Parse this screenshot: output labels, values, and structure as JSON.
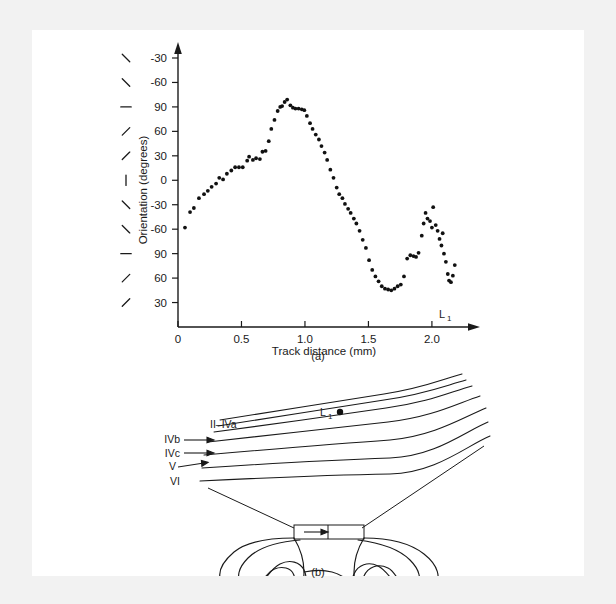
{
  "figure": {
    "panel_a_caption": "(a)",
    "panel_b_caption": "(b)"
  },
  "chart_data": {
    "type": "scatter",
    "title": "",
    "xlabel": "Track distance (mm)",
    "ylabel": "Orientation (degrees)",
    "xlim": [
      0,
      2.3
    ],
    "ylim": [
      0,
      330
    ],
    "grid": false,
    "legend": null,
    "xticks": [
      0,
      0.5,
      1.0,
      1.5,
      2.0
    ],
    "xticklabels": [
      "0",
      "0.5",
      "1.0",
      "1.5",
      "2.0"
    ],
    "yticks": [
      330,
      300,
      270,
      240,
      210,
      180,
      150,
      120,
      90,
      60,
      30
    ],
    "yticklabels": [
      "-30",
      "-60",
      "90",
      "60",
      "30",
      "0",
      "-30",
      "-60",
      "90",
      "60",
      "30"
    ],
    "ytick_orientation_glyphs": [
      "\\",
      "\\",
      "—",
      "/",
      "/",
      "|",
      "\\",
      "\\",
      "—",
      "/",
      "/"
    ],
    "annotations": [
      {
        "text": "L",
        "sub": "1",
        "x": 2.12,
        "y": 52
      }
    ],
    "series": [
      {
        "name": "orientation along track",
        "marker": "filled-circle",
        "color": "#111111",
        "points": [
          [
            0.055,
            122
          ],
          [
            0.095,
            141
          ],
          [
            0.125,
            146
          ],
          [
            0.165,
            158
          ],
          [
            0.205,
            163
          ],
          [
            0.235,
            167
          ],
          [
            0.265,
            172
          ],
          [
            0.3,
            176
          ],
          [
            0.325,
            183
          ],
          [
            0.355,
            181
          ],
          [
            0.385,
            188
          ],
          [
            0.42,
            192
          ],
          [
            0.45,
            196
          ],
          [
            0.48,
            196
          ],
          [
            0.51,
            196
          ],
          [
            0.545,
            204
          ],
          [
            0.56,
            209
          ],
          [
            0.59,
            205
          ],
          [
            0.615,
            207
          ],
          [
            0.645,
            206
          ],
          [
            0.665,
            215
          ],
          [
            0.69,
            216
          ],
          [
            0.715,
            228
          ],
          [
            0.735,
            243
          ],
          [
            0.76,
            254
          ],
          [
            0.785,
            265
          ],
          [
            0.805,
            270
          ],
          [
            0.82,
            271
          ],
          [
            0.84,
            276
          ],
          [
            0.86,
            279
          ],
          [
            0.885,
            272
          ],
          [
            0.905,
            269
          ],
          [
            0.925,
            268
          ],
          [
            0.95,
            268
          ],
          [
            0.975,
            267
          ],
          [
            0.995,
            266
          ],
          [
            1.015,
            259
          ],
          [
            1.04,
            250
          ],
          [
            1.06,
            243
          ],
          [
            1.085,
            236
          ],
          [
            1.11,
            230
          ],
          [
            1.13,
            222
          ],
          [
            1.155,
            214
          ],
          [
            1.175,
            205
          ],
          [
            1.2,
            193
          ],
          [
            1.225,
            183
          ],
          [
            1.25,
            171
          ],
          [
            1.27,
            163
          ],
          [
            1.295,
            158
          ],
          [
            1.315,
            151
          ],
          [
            1.34,
            145
          ],
          [
            1.36,
            140
          ],
          [
            1.385,
            133
          ],
          [
            1.405,
            127
          ],
          [
            1.43,
            118
          ],
          [
            1.455,
            107
          ],
          [
            1.48,
            97
          ],
          [
            1.505,
            82
          ],
          [
            1.53,
            70
          ],
          [
            1.555,
            62
          ],
          [
            1.58,
            56
          ],
          [
            1.605,
            50
          ],
          [
            1.63,
            47
          ],
          [
            1.655,
            46
          ],
          [
            1.68,
            45
          ],
          [
            1.705,
            47
          ],
          [
            1.73,
            50
          ],
          [
            1.755,
            52
          ],
          [
            1.78,
            62
          ],
          [
            1.805,
            84
          ],
          [
            1.83,
            88
          ],
          [
            1.855,
            87
          ],
          [
            1.875,
            86
          ],
          [
            1.895,
            91
          ],
          [
            1.92,
            112
          ],
          [
            1.935,
            127
          ],
          [
            1.95,
            140
          ],
          [
            1.965,
            133
          ],
          [
            1.985,
            130
          ],
          [
            2.0,
            122
          ],
          [
            2.01,
            147
          ],
          [
            2.03,
            125
          ],
          [
            2.045,
            118
          ],
          [
            2.06,
            108
          ],
          [
            2.075,
            100
          ],
          [
            2.085,
            115
          ],
          [
            2.095,
            90
          ],
          [
            2.11,
            80
          ],
          [
            2.125,
            65
          ],
          [
            2.135,
            57
          ],
          [
            2.15,
            55
          ],
          [
            2.165,
            63
          ],
          [
            2.18,
            76
          ]
        ]
      }
    ]
  },
  "diagram": {
    "layer_labels": [
      {
        "id": "layer-ii-iva",
        "text": "II–IVa"
      },
      {
        "id": "layer-ivb",
        "text": "IVb"
      },
      {
        "id": "layer-ivc",
        "text": "IVc"
      },
      {
        "id": "layer-v",
        "text": "V"
      },
      {
        "id": "layer-vi",
        "text": "VI"
      }
    ],
    "marker": {
      "text": "L",
      "sub": "1"
    }
  }
}
